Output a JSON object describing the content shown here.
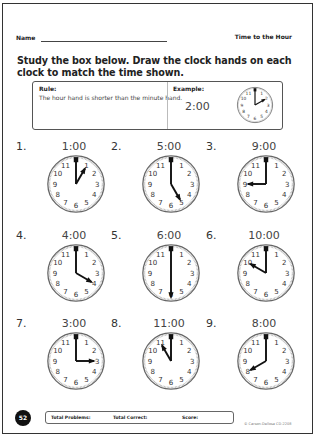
{
  "header": {
    "name_label": "Name",
    "title": "Time to the Hour"
  },
  "instructions": "Study the box below. Draw the clock hands on each clock to match the time shown.",
  "rule_box": {
    "rule_label": "Rule:",
    "rule_text": "The hour hand is shorter than the minute hand.",
    "example_label": "Example:",
    "example_time": "2:00",
    "example_hour": 2
  },
  "problems": [
    {
      "number": "1.",
      "time": "1:00",
      "hour": 1
    },
    {
      "number": "2.",
      "time": "5:00",
      "hour": 5
    },
    {
      "number": "3.",
      "time": "9:00",
      "hour": 9
    },
    {
      "number": "4.",
      "time": "4:00",
      "hour": 4
    },
    {
      "number": "5.",
      "time": "6:00",
      "hour": 6
    },
    {
      "number": "6.",
      "time": "10:00",
      "hour": 10
    },
    {
      "number": "7.",
      "time": "3:00",
      "hour": 3
    },
    {
      "number": "8.",
      "time": "11:00",
      "hour": 11
    },
    {
      "number": "9.",
      "time": "8:00",
      "hour": 8
    }
  ],
  "footer": {
    "page_number": "52",
    "total_problems_label": "Total Problems:",
    "total_correct_label": "Total Correct:",
    "score_label": "Score:",
    "copyright": "© Carson-Dellosa CD-2208"
  }
}
